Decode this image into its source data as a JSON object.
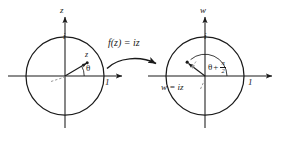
{
  "figure": {
    "background_color": "#ffffff",
    "stroke_color": "#1a1a1a",
    "dash_color": "#8c8c8c"
  },
  "mapping": {
    "label": "f(z) = iz",
    "arrow": "curved-right-arrow"
  },
  "left_plane": {
    "vertical_axis_label": "z",
    "horizontal_unit_label": "1",
    "imaginary_unit_label": "i",
    "point_label": "z",
    "angle_label": "θ",
    "circle": {
      "cx": 65,
      "cy": 76,
      "r": 39
    },
    "point": {
      "x": 87,
      "y": 63
    },
    "angle_degrees": 31
  },
  "right_plane": {
    "vertical_axis_label": "w",
    "horizontal_unit_label": "1",
    "imaginary_unit_label": "i",
    "point_label": "w = iz",
    "angle_label_theta": "θ",
    "angle_label_plus": "+",
    "angle_label_numerator": "π",
    "angle_label_denominator": "2",
    "circle": {
      "cx": 205,
      "cy": 76,
      "r": 39
    },
    "point": {
      "x": 187,
      "y": 62
    },
    "angle_degrees": 121
  }
}
